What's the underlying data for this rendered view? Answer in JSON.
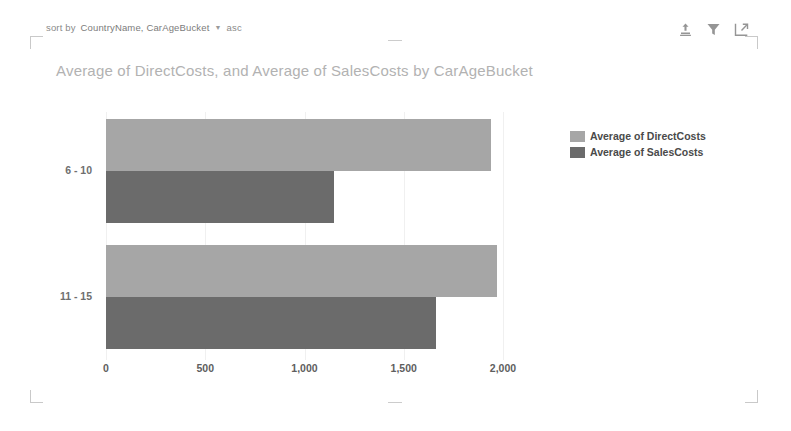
{
  "sort_bar": {
    "prefix": "sort by",
    "fields": "CountryName, CarAgeBucket",
    "caret": "▼",
    "direction": "asc"
  },
  "header_icons": [
    {
      "name": "drill-up-icon",
      "title": "Drill up"
    },
    {
      "name": "filter-icon",
      "title": "Filters"
    },
    {
      "name": "focus-mode-icon",
      "title": "Focus mode"
    }
  ],
  "legend": {
    "items": [
      {
        "label": "Average of DirectCosts",
        "color": "#a6a6a6"
      },
      {
        "label": "Average of SalesCosts",
        "color": "#6b6b6b"
      }
    ]
  },
  "chart_data": {
    "type": "bar",
    "orientation": "horizontal",
    "title": "Average of DirectCosts, and Average of SalesCosts by CarAgeBucket",
    "xlabel": "",
    "ylabel": "",
    "categories": [
      "6 - 10",
      "11 - 15"
    ],
    "series": [
      {
        "name": "Average of DirectCosts",
        "color": "#a6a6a6",
        "values": [
          1940,
          1970
        ]
      },
      {
        "name": "Average of SalesCosts",
        "color": "#6b6b6b",
        "values": [
          1150,
          1660
        ]
      }
    ],
    "xlim": [
      0,
      2000
    ],
    "xticks": [
      0,
      500,
      1000,
      1500,
      2000
    ],
    "xticklabels": [
      "0",
      "500",
      "1,000",
      "1,500",
      "2,000"
    ],
    "grid": true,
    "legend_position": "right"
  },
  "layout": {
    "plot_left_px": 106,
    "plot_right_px": 503,
    "group_tops_px": [
      119,
      245
    ],
    "bar_height_px": 52
  }
}
